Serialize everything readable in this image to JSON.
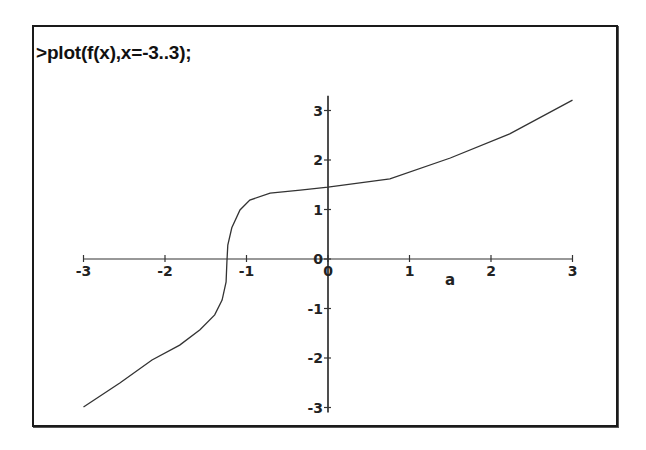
{
  "worksheet": {
    "command": ">plot(f(x),x=-3..3);"
  },
  "chart_data": {
    "type": "line",
    "title": "",
    "xlabel": "a",
    "ylabel": "",
    "xlim": [
      -3,
      3
    ],
    "ylim": [
      -3,
      3.3
    ],
    "grid": false,
    "legend": null,
    "x_ticks": [
      -3,
      -2,
      -1,
      0,
      1,
      2,
      3
    ],
    "y_ticks": [
      -3,
      -2,
      -1,
      0,
      1,
      2,
      3
    ],
    "x_tick_labels": [
      "-3",
      "-2",
      "-1",
      "0",
      "1",
      "2",
      "3"
    ],
    "y_tick_labels": [
      "-3",
      "-2",
      "-1",
      "0",
      "1",
      "2",
      "3"
    ],
    "series": [
      {
        "name": "f(x)",
        "color": "#333333",
        "x": [
          -3.0,
          -2.55,
          -2.16,
          -1.82,
          -1.57,
          -1.39,
          -1.3,
          -1.25,
          -1.24,
          -1.23,
          -1.18,
          -1.08,
          -0.96,
          -0.71,
          -0.34,
          0.0,
          0.76,
          1.5,
          2.23,
          3.0
        ],
        "y": [
          -2.99,
          -2.5,
          -2.04,
          -1.74,
          -1.43,
          -1.13,
          -0.83,
          -0.46,
          -0.06,
          0.28,
          0.63,
          0.99,
          1.19,
          1.33,
          1.39,
          1.45,
          1.62,
          2.04,
          2.53,
          3.21
        ]
      }
    ]
  }
}
